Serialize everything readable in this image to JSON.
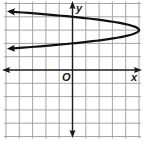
{
  "chart_data": {
    "type": "line",
    "title": "",
    "xlabel": "x",
    "ylabel": "y",
    "origin_label": "O",
    "xlim": [
      -5,
      5
    ],
    "ylim": [
      -5,
      5
    ],
    "grid": true,
    "grid_step": 1,
    "legend": null,
    "series": [
      {
        "name": "x = -5(y - 3)^2 + 5",
        "description": "Parabola opening left, vertex at (5, 3), passes through (0, 4) and (0, 2), arrows pointing left",
        "vertex": [
          5,
          3
        ],
        "points": [
          [
            -5,
            4.41
          ],
          [
            -3,
            4.26
          ],
          [
            0,
            4
          ],
          [
            3,
            3.63
          ],
          [
            4.5,
            3.32
          ],
          [
            5,
            3
          ],
          [
            4.5,
            2.68
          ],
          [
            3,
            2.37
          ],
          [
            0,
            2
          ],
          [
            -3,
            1.74
          ],
          [
            -5,
            1.59
          ]
        ]
      }
    ]
  },
  "colors": {
    "grid": "#9a9a9a",
    "axis": "#1a1a1a",
    "curve": "#111111",
    "background": "#ffffff"
  }
}
